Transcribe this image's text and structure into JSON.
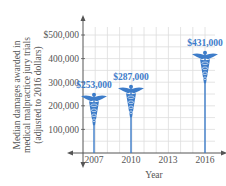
{
  "chart_data": {
    "type": "bar",
    "style": "pictograph-caduceus",
    "title": "",
    "xlabel": "Year",
    "ylabel": "Median damages awarded in medical malpractice jury trials (adjusted to 2016 dollars)",
    "ylabel_lines": [
      "Median damages awarded in",
      "medical malpractice jury trials",
      "(adjusted to 2016 dollars)"
    ],
    "categories": [
      "2007",
      "2010",
      "2016"
    ],
    "values": [
      253000,
      287000,
      431000
    ],
    "data_labels": [
      "$253,000",
      "$287,000",
      "$431,000"
    ],
    "x_ticks": [
      "2007",
      "2010",
      "2013",
      "2016"
    ],
    "y_ticks": [
      {
        "value": 100000,
        "label": "100,000"
      },
      {
        "value": 200000,
        "label": "200,000"
      },
      {
        "value": 300000,
        "label": "300,000"
      },
      {
        "value": 400000,
        "label": "400,000"
      },
      {
        "value": 500000,
        "label": "$500,000"
      }
    ],
    "ylim": [
      0,
      500000
    ],
    "grid": true,
    "legend": null,
    "colors": {
      "bar": "#3d7cc9",
      "grid": "#dddddd",
      "axis": "#555555",
      "text": "#555555"
    }
  }
}
